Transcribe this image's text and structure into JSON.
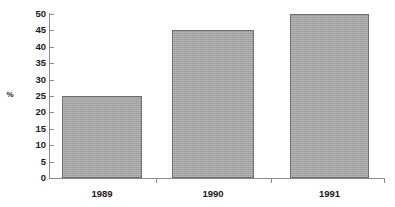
{
  "chart_data": {
    "type": "bar",
    "title": "",
    "subtitle": "",
    "xlabel": "",
    "ylabel": "%",
    "categories": [
      "1989",
      "1990",
      "1991"
    ],
    "values": [
      25,
      45,
      50
    ],
    "series": [
      {
        "name": "",
        "values": [
          25,
          45,
          50
        ]
      }
    ],
    "ylim": [
      0,
      50
    ],
    "ytick_values": [
      0,
      5,
      10,
      15,
      20,
      25,
      30,
      35,
      40,
      45,
      50
    ],
    "ytick_labels": [
      "0",
      "5",
      "10",
      "15",
      "20",
      "25",
      "30",
      "35",
      "40",
      "45",
      "50"
    ],
    "grid": false,
    "legend": false,
    "legend_position": "none",
    "bar_color": "#a9a9a9",
    "bar_edge_color": "#6e6e6e",
    "axis_color": "#8a8a8a",
    "text_color": "#1a1a1a",
    "background_color": "#ffffff"
  }
}
